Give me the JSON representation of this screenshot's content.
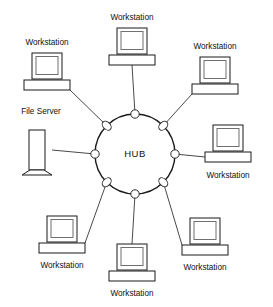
{
  "diagram": {
    "type": "star-topology-network",
    "background_color": "#ffffff",
    "line_color": "#4a4a4a",
    "outline_color": "#1a1a1a",
    "screen_color": "#6f6f6f",
    "hub": {
      "label": "HUB",
      "center_x": 135,
      "center_y": 154,
      "radius": 40,
      "port_count": 8
    },
    "nodes": [
      {
        "id": "workstation-top-left",
        "label": "Workstation",
        "kind": "workstation",
        "label_position": "above",
        "label_x": 47,
        "label_y": 43,
        "icon_x": 47,
        "icon_y": 71,
        "port_index": 6
      },
      {
        "id": "workstation-top-center",
        "label": "Workstation",
        "kind": "workstation",
        "label_position": "above",
        "label_x": 132,
        "label_y": 18,
        "icon_x": 132,
        "icon_y": 46,
        "port_index": 7
      },
      {
        "id": "workstation-top-right",
        "label": "Workstation",
        "kind": "workstation",
        "label_position": "above",
        "label_x": 215,
        "label_y": 47,
        "icon_x": 215,
        "icon_y": 75,
        "port_index": 0
      },
      {
        "id": "workstation-right",
        "label": "Workstation",
        "kind": "workstation",
        "label_position": "below",
        "label_x": 228,
        "label_y": 176,
        "icon_x": 228,
        "icon_y": 143,
        "port_index": 1
      },
      {
        "id": "workstation-bottom-right",
        "label": "Workstation",
        "kind": "workstation",
        "label_position": "below",
        "label_x": 205,
        "label_y": 268,
        "icon_x": 205,
        "icon_y": 236,
        "port_index": 2
      },
      {
        "id": "workstation-bottom-center",
        "label": "Workstation",
        "kind": "workstation",
        "label_position": "below",
        "label_x": 132,
        "label_y": 294,
        "icon_x": 132,
        "icon_y": 262,
        "port_index": 3
      },
      {
        "id": "workstation-bottom-left",
        "label": "Workstation",
        "kind": "workstation",
        "label_position": "below",
        "label_x": 62,
        "label_y": 266,
        "icon_x": 62,
        "icon_y": 234,
        "port_index": 4
      },
      {
        "id": "file-server",
        "label": "File Server",
        "kind": "server",
        "label_position": "above",
        "label_x": 41,
        "label_y": 112,
        "icon_x": 37,
        "icon_y": 150,
        "port_index": 5
      }
    ]
  }
}
